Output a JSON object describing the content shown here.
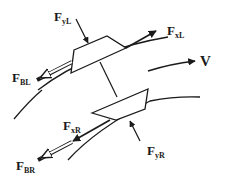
{
  "diagram": {
    "labels": {
      "fyl": {
        "main": "F",
        "sub": "yL"
      },
      "fxl": {
        "main": "F",
        "sub": "xL"
      },
      "fbl": {
        "main": "F",
        "sub": "BL"
      },
      "v": {
        "main": "V"
      },
      "fxr": {
        "main": "F",
        "sub": "xR"
      },
      "fyr": {
        "main": "F",
        "sub": "yR"
      },
      "fbr": {
        "main": "F",
        "sub": "BR"
      }
    },
    "colors": {
      "ink": "#1a1a1a",
      "background": "#ffffff"
    }
  }
}
